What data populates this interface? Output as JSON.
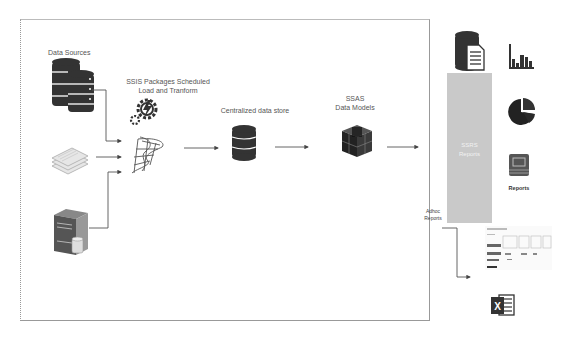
{
  "diagram": {
    "nodes": {
      "data_sources": {
        "label": "Data Sources"
      },
      "ssis": {
        "label_line1": "SSIS Packages Scheduled",
        "label_line2": "Load and Tranform"
      },
      "central_store": {
        "label": "Centralized data store"
      },
      "ssas": {
        "label_line1": "SSAS",
        "label_line2": "Data Models"
      },
      "ssrs": {
        "label_line1": "SSRS",
        "label_line2": "Reports"
      },
      "reports_icon": {
        "label": "Reports"
      },
      "adhoc": {
        "label_line1": "Adhoc",
        "label_line2": "Reports"
      }
    },
    "colors": {
      "icon_dark": "#333333",
      "ssrs_box": "#c9c9c9",
      "arrow": "#555555",
      "frame": "#999999"
    }
  }
}
